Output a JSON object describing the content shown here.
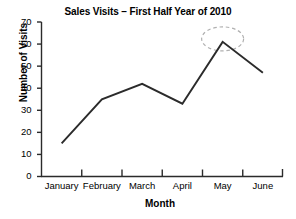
{
  "chart_data": {
    "type": "line",
    "title": "Sales Visits – First Half Year of 2010",
    "xlabel": "Month",
    "ylabel": "Number of Visits",
    "categories": [
      "January",
      "February",
      "March",
      "April",
      "May",
      "June"
    ],
    "values": [
      15,
      35,
      42,
      33,
      61,
      47
    ],
    "series": [
      {
        "name": "Number of Visits",
        "values": [
          15,
          35,
          42,
          33,
          61,
          47
        ]
      }
    ],
    "ylim": [
      0,
      70
    ],
    "yticks": [
      0,
      10,
      20,
      30,
      40,
      50,
      60,
      70
    ],
    "ytick_labels": [
      "0",
      "10",
      "20",
      "30",
      "40",
      "50",
      "60",
      "70"
    ],
    "grid": false,
    "legend": false,
    "legend_position": "none",
    "line_color": "#2b2b2b",
    "axis_color": "#2b2b2b",
    "background_color": "#ffffff",
    "annotations": [
      {
        "type": "ellipse",
        "label": "may-peak-highlight",
        "target_category": "May",
        "target_value": 61,
        "style": "dashed",
        "color": "#b0b0b0"
      }
    ]
  }
}
